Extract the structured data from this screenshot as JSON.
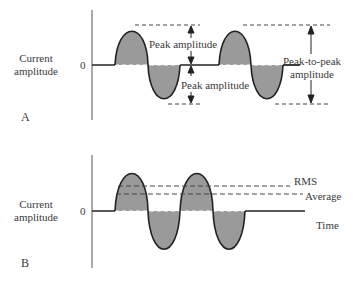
{
  "panel_a": {
    "letter": "A",
    "y_label_line1": "Current",
    "y_label_line2": "amplitude",
    "zero_label": "0",
    "peak_amplitude_upper": "Peak amplitude",
    "peak_amplitude_lower": "Peak amplitude",
    "peak_to_peak_line1": "Peak-to-peak",
    "peak_to_peak_line2": "amplitude"
  },
  "panel_b": {
    "letter": "B",
    "y_label_line1": "Current",
    "y_label_line2": "amplitude",
    "zero_label": "0",
    "rms_label": "RMS",
    "average_label": "Average",
    "x_label": "Time"
  },
  "colors": {
    "fill": "#9a9a9a",
    "stroke": "#222222",
    "dash": "#444444"
  }
}
